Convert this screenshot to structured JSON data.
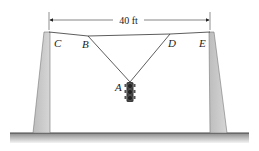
{
  "diagram": {
    "dimension": {
      "label": "40 ft"
    },
    "points": {
      "A": "A",
      "B": "B",
      "C": "C",
      "D": "D",
      "E": "E"
    },
    "colors": {
      "pole_fill": "#c8c8c8",
      "pole_stroke": "#666666",
      "cable": "#333333",
      "ground_top": "#8a8a8a",
      "ground_bottom": "#f2f2f2",
      "traffic_light": "#333333"
    }
  }
}
